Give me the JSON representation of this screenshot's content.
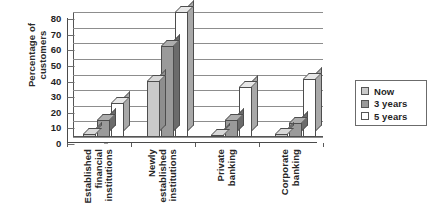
{
  "chart_data": {
    "type": "bar",
    "title": "",
    "subtitle": "",
    "xlabel": "",
    "ylabel": "Percentage of customers",
    "ylabel_lines": [
      "Percentage of",
      "customers"
    ],
    "ylim": [
      0,
      80
    ],
    "ytick_step": 10,
    "yticks": [
      80,
      70,
      60,
      50,
      40,
      30,
      20,
      10,
      0
    ],
    "grid": true,
    "grid_axis": "y",
    "legend_position": "right",
    "style": "3d-bar-grayscale",
    "categories": [
      "Established financial institutions",
      "Newly established institutions",
      "Private banking",
      "Corporate banking"
    ],
    "category_label_lines": [
      [
        "Established",
        "financial",
        "institutions"
      ],
      [
        "Newly",
        "established",
        "institutions"
      ],
      [
        "Private",
        "banking"
      ],
      [
        "Corporate",
        "banking"
      ]
    ],
    "series": [
      {
        "name": "Now",
        "color": "#c9c9c9",
        "values": [
          2,
          36,
          1,
          2
        ]
      },
      {
        "name": "3 years",
        "color": "#9a9a9a",
        "values": [
          11,
          58,
          11,
          9
        ]
      },
      {
        "name": "5 years",
        "color": "#ffffff",
        "values": [
          22,
          80,
          32,
          37
        ]
      }
    ]
  },
  "legend": {
    "items": [
      {
        "label": "Now",
        "swatch": "#c9c9c9"
      },
      {
        "label": "3 years",
        "swatch": "#9a9a9a"
      },
      {
        "label": "5 years",
        "swatch": "#ffffff"
      }
    ]
  },
  "axis": {
    "y_title_line1": "Percentage of",
    "y_title_line2": "customers"
  },
  "colors": {
    "series_now": "#c9c9c9",
    "series_3_years": "#9a9a9a",
    "series_5_years": "#ffffff",
    "gridline": "#8d8d8d",
    "axis": "#4a4a4a",
    "text": "#1f1f1f",
    "background": "#ffffff"
  }
}
